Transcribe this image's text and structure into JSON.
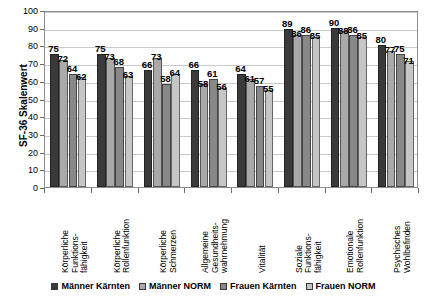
{
  "chart_data": {
    "type": "bar",
    "title": "",
    "xlabel": "",
    "ylabel": "SF-36 Skalenwert",
    "ylim": [
      0,
      100
    ],
    "ytick_step": 10,
    "yticks": [
      0,
      10,
      20,
      30,
      40,
      50,
      60,
      70,
      80,
      90,
      100
    ],
    "grid": true,
    "legend_position": "bottom",
    "categories": [
      "Körperliche Funktions-fähigkeit",
      "Körperliche Rollenfunktion",
      "Körperliche Schmerzen",
      "Allgemeine Gesundheits-wahrnehmung",
      "Vitalität",
      "Soziale Funktions-fähigkeit",
      "Emotionale Rollenfunktion",
      "Psychisches Wohlbefinden"
    ],
    "category_lines": [
      [
        "Körperliche",
        "Funktions-",
        "fähigkeit"
      ],
      [
        "Körperliche",
        "Rollenfunktion"
      ],
      [
        "Körperliche",
        "Schmerzen"
      ],
      [
        "Allgemeine",
        "Gesundheits-",
        "wahrnehmung"
      ],
      [
        "Vitalität"
      ],
      [
        "Soziale",
        "Funktions-",
        "fähigkeit"
      ],
      [
        "Emotionale",
        "Rollenfunktion"
      ],
      [
        "Psychisches",
        "Wohlbefinden"
      ]
    ],
    "series": [
      {
        "name": "Männer Kärnten",
        "color": "#3a3a3a",
        "values": [
          75,
          75,
          66,
          66,
          64,
          89,
          90,
          80
        ]
      },
      {
        "name": "Männer NORM",
        "color": "#a9a9a9",
        "values": [
          72,
          73,
          73,
          58,
          61,
          86,
          88,
          77
        ]
      },
      {
        "name": "Frauen Kärnten",
        "color": "#888888",
        "values": [
          64,
          68,
          58,
          61,
          57,
          86,
          86,
          75
        ]
      },
      {
        "name": "Frauen NORM",
        "color": "#c6c6c6",
        "values": [
          62,
          63,
          64,
          56,
          55,
          85,
          85,
          71
        ]
      }
    ]
  },
  "axis": {
    "y_title": "SF-36 Skalenwert"
  },
  "legend": {
    "items": [
      {
        "label": "Männer Kärnten",
        "color": "#3a3a3a"
      },
      {
        "label": "Männer NORM",
        "color": "#a9a9a9"
      },
      {
        "label": "Frauen Kärnten",
        "color": "#888888"
      },
      {
        "label": "Frauen NORM",
        "color": "#c6c6c6"
      }
    ]
  }
}
